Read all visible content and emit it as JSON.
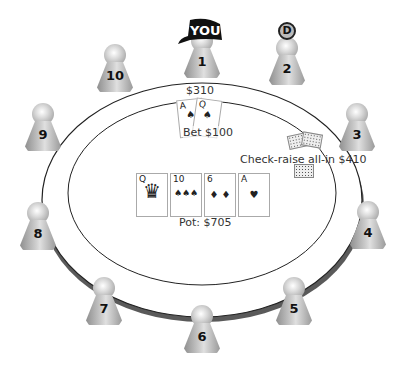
{
  "table": {
    "stacks": {
      "seat1": "$310"
    },
    "actions": {
      "seat1_bet": "Bet $100",
      "seat3_action": "Check-raise all-in $410"
    },
    "pot_label": "Pot: $705",
    "colors": {
      "felt": "#ffffff",
      "rail": "#555555",
      "outline": "#222222"
    }
  },
  "hero": {
    "cap_text": "YOU",
    "seat": "1"
  },
  "dealer_button": {
    "label": "D",
    "seat": "2"
  },
  "seats": [
    {
      "number": "1"
    },
    {
      "number": "2"
    },
    {
      "number": "3"
    },
    {
      "number": "4"
    },
    {
      "number": "5"
    },
    {
      "number": "6"
    },
    {
      "number": "7"
    },
    {
      "number": "8"
    },
    {
      "number": "9"
    },
    {
      "number": "10"
    }
  ],
  "hero_cards": [
    {
      "rank": "A",
      "suit": "♠"
    },
    {
      "rank": "Q",
      "suit": "♠"
    }
  ],
  "board": [
    {
      "rank": "Q",
      "suit": "♠",
      "mid": "♛"
    },
    {
      "rank": "10",
      "suit": "♠",
      "mid": "♠♠♠"
    },
    {
      "rank": "6",
      "suit": "♦",
      "mid": "♦ ♦"
    },
    {
      "rank": "A",
      "suit": "♥",
      "mid": "♥"
    }
  ]
}
